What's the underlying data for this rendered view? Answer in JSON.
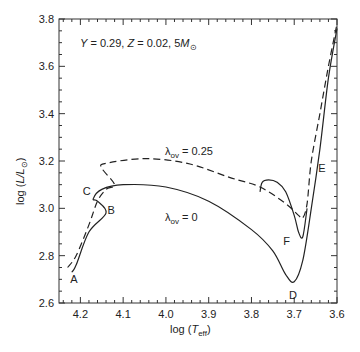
{
  "chart_data": {
    "type": "line",
    "annotation": {
      "text_Y": "Y",
      "eq1": " = 0.29, ",
      "text_Z": "Z",
      "eq2": " = 0.02, 5",
      "text_M": "M",
      "sun_sub": "⊙"
    },
    "xlabel": "log (T_eff)",
    "xlabel_parts": {
      "pre": "log (",
      "T": "T",
      "sub": "eff",
      "post": ")"
    },
    "ylabel": "log (L/L⊙)",
    "ylabel_parts": {
      "pre": "log (",
      "L": "L/L",
      "sub": "⊙",
      "post": ")"
    },
    "xlim": [
      4.25,
      3.6
    ],
    "ylim": [
      2.6,
      3.8
    ],
    "x_ticks": [
      "4.2",
      "4.1",
      "4.0",
      "3.9",
      "3.8",
      "3.7",
      "3.6"
    ],
    "y_ticks": [
      "2.6",
      "2.8",
      "3.0",
      "3.2",
      "3.4",
      "3.6",
      "3.8"
    ],
    "grid": false,
    "series": [
      {
        "name": "λov = 0",
        "label_main": "λ",
        "label_sub": "ov",
        "label_eq": " = 0",
        "style": "solid",
        "x": [
          4.22,
          4.21,
          4.18,
          4.14,
          4.16,
          4.17,
          4.15,
          4.1,
          4.0,
          3.9,
          3.8,
          3.75,
          3.72,
          3.7,
          3.68,
          3.66,
          3.64,
          3.62,
          3.6
        ],
        "y": [
          2.73,
          2.76,
          2.9,
          2.98,
          3.03,
          3.04,
          3.08,
          3.1,
          3.09,
          3.03,
          2.91,
          2.82,
          2.72,
          2.69,
          2.78,
          3.0,
          3.25,
          3.55,
          3.76
        ]
      },
      {
        "name": "λov = 0 (blue loop)",
        "style": "solid",
        "x": [
          3.78,
          3.775,
          3.76,
          3.74,
          3.72,
          3.7,
          3.69,
          3.68,
          3.67
        ],
        "y": [
          3.07,
          3.11,
          3.12,
          3.11,
          3.07,
          2.97,
          2.9,
          2.88,
          3.0
        ]
      },
      {
        "name": "λov = 0.25",
        "label_main": "λ",
        "label_sub": "ov",
        "label_eq": " = 0.25",
        "style": "dashed",
        "x": [
          4.23,
          4.21,
          4.18,
          4.16,
          4.14,
          4.12,
          4.15,
          4.14,
          4.05,
          3.95,
          3.85,
          3.78,
          3.72,
          3.69,
          3.68,
          3.67,
          3.66,
          3.64,
          3.62,
          3.6
        ],
        "y": [
          2.75,
          2.8,
          2.93,
          3.03,
          3.08,
          3.1,
          3.17,
          3.19,
          3.21,
          3.19,
          3.13,
          3.09,
          3.02,
          2.97,
          2.96,
          3.02,
          3.2,
          3.4,
          3.6,
          3.78
        ]
      }
    ],
    "point_labels": [
      {
        "text": "A",
        "x": 4.215,
        "y": 2.685
      },
      {
        "text": "B",
        "x": 4.128,
        "y": 2.975
      },
      {
        "text": "C",
        "x": 4.185,
        "y": 3.055
      },
      {
        "text": "D",
        "x": 3.703,
        "y": 2.615
      },
      {
        "text": "E",
        "x": 3.635,
        "y": 3.155
      },
      {
        "text": "F",
        "x": 3.718,
        "y": 2.845
      }
    ]
  }
}
